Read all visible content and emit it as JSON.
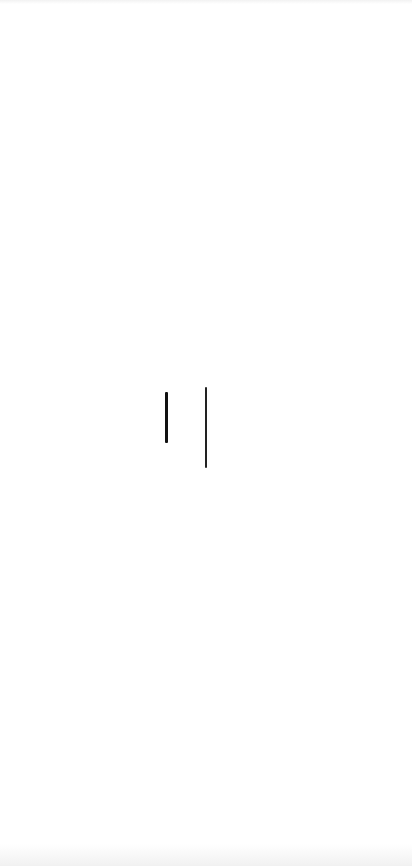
{
  "screen": {
    "type": "splash",
    "background_color": "#ffffff",
    "logo": {
      "icon": "logo-marks-icon",
      "marks": [
        {
          "name": "left-stroke",
          "color": "#111111"
        },
        {
          "name": "right-stroke",
          "color": "#222222"
        }
      ]
    }
  }
}
